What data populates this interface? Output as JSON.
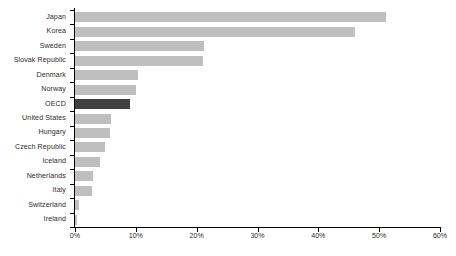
{
  "chart_data": {
    "type": "bar",
    "orientation": "horizontal",
    "title": "",
    "xlabel": "",
    "ylabel": "",
    "xlim": [
      0,
      60
    ],
    "xtick_labels": [
      "0%",
      "10%",
      "20%",
      "30%",
      "40%",
      "50%",
      "60%"
    ],
    "xtick_values": [
      0,
      10,
      20,
      30,
      40,
      50,
      60
    ],
    "grid": false,
    "legend": "none",
    "bar_color": "#bfbfbf",
    "highlight_color": "#404040",
    "highlight_category": "OECD",
    "categories": [
      "Japan",
      "Korea",
      "Sweden",
      "Slovak Republic",
      "Denmark",
      "Norway",
      "OECD",
      "United States",
      "Hungary",
      "Czech Republic",
      "Iceland",
      "Netherlands",
      "Italy",
      "Switzerland",
      "Ireland"
    ],
    "values": [
      51.2,
      46.0,
      21.2,
      21.1,
      10.4,
      10.0,
      9.1,
      5.9,
      5.8,
      4.9,
      4.1,
      2.9,
      2.8,
      0.6,
      0.4
    ]
  }
}
